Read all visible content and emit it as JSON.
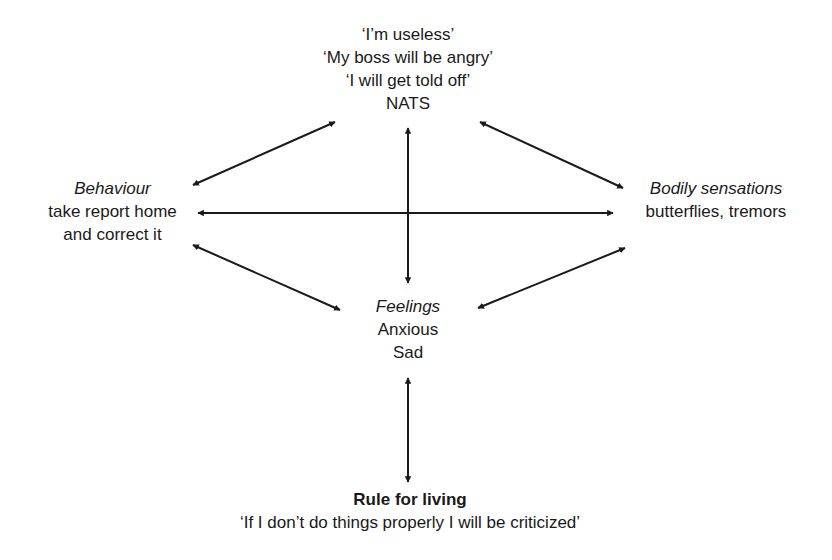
{
  "diagram": {
    "nodes": {
      "nats": {
        "lines": [
          "‘I’m useless’",
          "‘My boss will be angry’",
          "‘I will get told off’"
        ],
        "label": "NATS"
      },
      "behaviour": {
        "heading": "Behaviour",
        "lines": [
          "take report home",
          "and correct it"
        ]
      },
      "bodily": {
        "heading": "Bodily sensations",
        "lines": [
          "butterflies, tremors"
        ]
      },
      "feelings": {
        "heading": "Feelings",
        "lines": [
          "Anxious",
          "Sad"
        ]
      },
      "rule": {
        "heading": "Rule for living",
        "lines": [
          "‘If I don’t do things properly I will be criticized’"
        ]
      }
    },
    "edges": [
      {
        "from": "nats",
        "to": "behaviour",
        "type": "bidirectional"
      },
      {
        "from": "nats",
        "to": "bodily",
        "type": "bidirectional"
      },
      {
        "from": "nats",
        "to": "feelings",
        "type": "bidirectional"
      },
      {
        "from": "behaviour",
        "to": "bodily",
        "type": "bidirectional"
      },
      {
        "from": "behaviour",
        "to": "feelings",
        "type": "bidirectional"
      },
      {
        "from": "bodily",
        "to": "feelings",
        "type": "bidirectional"
      },
      {
        "from": "feelings",
        "to": "rule",
        "type": "bidirectional"
      }
    ],
    "colors": {
      "ink": "#1a1a1a",
      "background": "#ffffff"
    }
  }
}
